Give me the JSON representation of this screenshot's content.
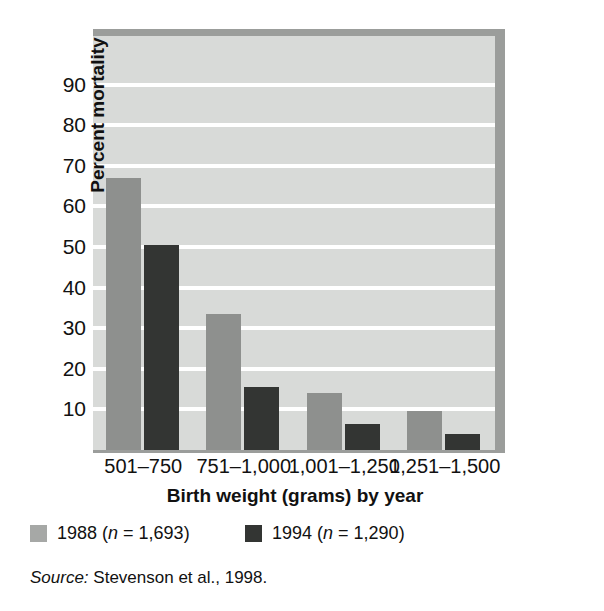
{
  "chart_data": {
    "type": "bar",
    "title": "",
    "xlabel": "Birth weight (grams) by year",
    "ylabel": "Percent mortality",
    "categories": [
      "501–750",
      "751–1,000",
      "1,001–1,250",
      "1,251–1,500"
    ],
    "series": [
      {
        "name": "1988 (n = 1,693)",
        "short_name": "1988",
        "n": "1,693",
        "color": "#8e908e",
        "values": [
          67,
          33.5,
          14,
          9.5
        ]
      },
      {
        "name": "1994 (n = 1,290)",
        "short_name": "1994",
        "n": "1,290",
        "color": "#333533",
        "values": [
          50.5,
          15.5,
          6.5,
          4
        ]
      }
    ],
    "ylim": [
      0,
      102
    ],
    "yticks": [
      10,
      20,
      30,
      40,
      50,
      60,
      70,
      80,
      90
    ],
    "ytick_labels": [
      "10",
      "20",
      "30",
      "40",
      "50",
      "60",
      "70",
      "80",
      "90"
    ],
    "grid": "horizontal-white-lines",
    "legend_position": "below-axis",
    "plot_background": "#d8dad8",
    "shadow_color": "#9b9d9b"
  },
  "axis": {
    "y_title": "Percent mortality",
    "x_title": "Birth weight (grams) by year"
  },
  "legend": {
    "items": [
      {
        "year": "1988 ",
        "paren_open": "(",
        "n_italic": "n",
        "n_value": " = 1,693",
        "paren_close": ")"
      },
      {
        "year": "1994 ",
        "paren_open": "(",
        "n_italic": "n",
        "n_value": " = 1,290",
        "paren_close": ")"
      }
    ]
  },
  "source": {
    "keyword": "Source:",
    "text": " Stevenson et al., 1998."
  }
}
